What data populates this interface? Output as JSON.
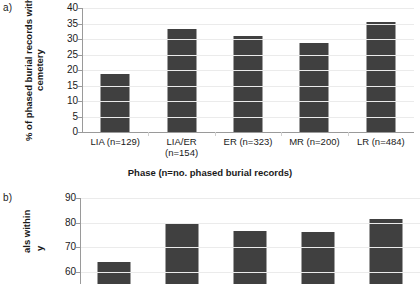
{
  "figure": {
    "panel_a_tag": "a)",
    "panel_b_tag": "b)"
  },
  "chart_data": [
    {
      "type": "bar",
      "panel": "a)",
      "title": "",
      "categories": [
        "LIA (n=129)",
        "LIA/ER (n=154)",
        "ER (n=323)",
        "MR (n=200)",
        "LR (n=484)"
      ],
      "category_lines": [
        [
          "LIA (n=129)"
        ],
        [
          "LIA/ER",
          "(n=154)"
        ],
        [
          "ER (n=323)"
        ],
        [
          "MR (n=200)"
        ],
        [
          "LR (n=484)"
        ]
      ],
      "values": [
        18.7,
        33.1,
        31.0,
        28.6,
        35.6
      ],
      "ylabel_line1": "% of phased burial records with",
      "ylabel_line2": "cemetery",
      "xlabel": "Phase (n=no. phased burial records)",
      "ylim": [
        0,
        40
      ],
      "yticks": [
        40,
        35,
        30,
        25,
        20,
        15,
        10,
        5,
        0
      ],
      "grid": true,
      "legend": "none",
      "bar_color": "#404040"
    },
    {
      "type": "bar",
      "panel": "b)",
      "title": "",
      "categories": [
        "LIA (n=129)",
        "LIA/ER (n=154)",
        "ER (n=323)",
        "MR (n=200)",
        "LR (n=484)"
      ],
      "values": [
        64.0,
        79.5,
        76.7,
        76.3,
        81.5
      ],
      "ylabel_line1": "als within",
      "ylabel_line2": "y",
      "xlabel": "",
      "ylim": [
        55,
        90
      ],
      "yticks": [
        90,
        80,
        70,
        60
      ],
      "grid": true,
      "legend": "none",
      "bar_color": "#404040",
      "note_clipped": "panel cropped at image bottom edge"
    }
  ]
}
